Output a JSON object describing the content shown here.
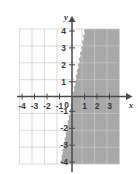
{
  "figure": {
    "kind": "cartesian-coordinate-plane",
    "axis_labels": {
      "x": "x",
      "y": "y"
    },
    "x_ticks": [
      "-4",
      "-3",
      "-2",
      "-1",
      "1",
      "2",
      "3"
    ],
    "y_ticks": [
      "4",
      "3",
      "2",
      "1",
      "-1",
      "-2",
      "-3",
      "-4"
    ],
    "origin_label": "0",
    "x_range": [
      -4.2,
      3.75
    ],
    "y_range": [
      -4.5,
      4.4
    ],
    "grid": true,
    "colors": {
      "grid_line": "#c9c9c9",
      "axis_line": "#4a4a4a",
      "shaded_region": "#a8a8a8",
      "boundary_line": "#ffffff",
      "plot_background": "#ffffff",
      "tick_text": "#3a3a3a"
    },
    "boundary": {
      "style": "dashed",
      "slope": 3,
      "y_intercept": 0.9,
      "included": false
    },
    "shading": {
      "side": "right-of-line",
      "description": "region to the right of / below the dashed boundary line is shaded gray"
    }
  }
}
